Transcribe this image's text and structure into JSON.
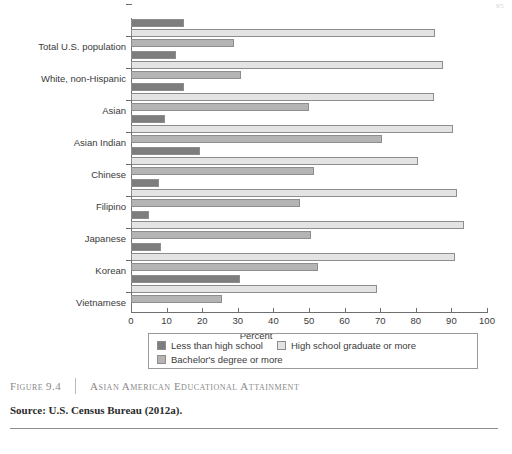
{
  "page_number": "95",
  "figure": {
    "number": "Figure 9.4",
    "title": "Asian American Educational Attainment",
    "source": "Source: U.S. Census Bureau (2012a)."
  },
  "legend": {
    "items": [
      {
        "label": "Less than high school",
        "color": "#7d7d7d"
      },
      {
        "label": "High school graduate or more",
        "color": "#e3e3e3"
      },
      {
        "label": "Bachelor's degree or more",
        "color": "#b4b4b4"
      }
    ]
  },
  "chart_data": {
    "type": "bar",
    "orientation": "horizontal",
    "title": "Asian American Educational Attainment",
    "xlabel": "Percent",
    "ylabel": "",
    "xlim": [
      0,
      100
    ],
    "xticks": [
      0,
      10,
      20,
      30,
      40,
      50,
      60,
      70,
      80,
      90,
      100
    ],
    "grid": false,
    "legend_position": "bottom",
    "categories": [
      "Total U.S. population",
      "White, non-Hispanic",
      "Asian",
      "Asian Indian",
      "Chinese",
      "Filipino",
      "Japanese",
      "Korean",
      "Vietnamese"
    ],
    "series": [
      {
        "name": "Less than high school",
        "color": "#7d7d7d",
        "values": [
          15.0,
          12.5,
          15.0,
          9.5,
          19.5,
          8.0,
          5.0,
          8.5,
          30.5
        ]
      },
      {
        "name": "High school graduate or more",
        "color": "#e3e3e3",
        "values": [
          85.5,
          87.5,
          85.0,
          90.5,
          80.5,
          91.5,
          93.5,
          91.0,
          69.0
        ]
      },
      {
        "name": "Bachelor's degree or more",
        "color": "#b4b4b4",
        "values": [
          29.0,
          31.0,
          50.0,
          70.5,
          51.5,
          47.5,
          50.5,
          52.5,
          25.5
        ]
      }
    ]
  }
}
